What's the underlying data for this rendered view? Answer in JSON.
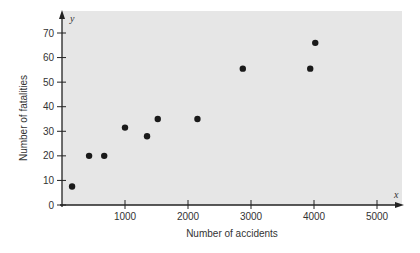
{
  "chart_data": {
    "type": "scatter",
    "title": "",
    "xlabel": "Number of accidents",
    "ylabel": "Number of fatalities",
    "x_axis_var": "x",
    "y_axis_var": "y",
    "xlim": [
      0,
      5400
    ],
    "ylim": [
      0,
      78
    ],
    "xticks": [
      1000,
      2000,
      3000,
      4000,
      5000
    ],
    "xtick_labels": [
      "1000",
      "2000",
      "3000",
      "4000",
      "5000"
    ],
    "yticks": [
      0,
      10,
      20,
      30,
      40,
      50,
      60,
      70
    ],
    "ytick_labels": [
      "0",
      "10",
      "20",
      "30",
      "40",
      "50",
      "60",
      "70"
    ],
    "grid": false,
    "legend": null,
    "points": [
      {
        "x": 160,
        "y": 7.5
      },
      {
        "x": 430,
        "y": 20
      },
      {
        "x": 670,
        "y": 20
      },
      {
        "x": 1000,
        "y": 31.5
      },
      {
        "x": 1350,
        "y": 28
      },
      {
        "x": 1520,
        "y": 35
      },
      {
        "x": 2150,
        "y": 35
      },
      {
        "x": 2870,
        "y": 55.5
      },
      {
        "x": 3940,
        "y": 55.5
      },
      {
        "x": 4020,
        "y": 66
      }
    ]
  },
  "colors": {
    "plot_background": "#e6e6e6",
    "point": "#1a1a1a",
    "axis": "#222222"
  }
}
